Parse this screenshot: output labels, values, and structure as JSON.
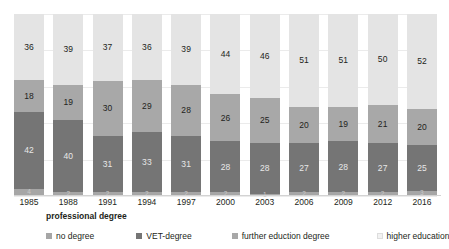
{
  "chart_data": {
    "type": "bar",
    "subtype": "stacked-100-percent",
    "title": "",
    "xlabel": "professional degree",
    "ylabel": "",
    "ylim": [
      0,
      100
    ],
    "grid": true,
    "legend_position": "bottom",
    "categories": [
      "1985",
      "1988",
      "1991",
      "1994",
      "1997",
      "2000",
      "2003",
      "2006",
      "2009",
      "2012",
      "2016"
    ],
    "series": [
      {
        "name": "no degree",
        "color": "#a6a6a6",
        "values": [
          4,
          2,
          2,
          2,
          2,
          2,
          1,
          2,
          2,
          2,
          3
        ]
      },
      {
        "name": "VET-degree",
        "color": "#757575",
        "values": [
          42,
          40,
          31,
          33,
          31,
          28,
          28,
          27,
          28,
          27,
          25
        ]
      },
      {
        "name": "further eduction degree",
        "color": "#a8a8a8",
        "values": [
          18,
          19,
          30,
          29,
          28,
          26,
          25,
          20,
          19,
          21,
          20
        ]
      },
      {
        "name": "higher education",
        "color": "#e4e4e4",
        "values": [
          36,
          39,
          37,
          36,
          39,
          44,
          46,
          51,
          51,
          50,
          52
        ]
      }
    ]
  },
  "axis": {
    "title": "professional degree"
  },
  "legend": {
    "items": [
      {
        "label": "no degree",
        "color": "#a6a6a6"
      },
      {
        "label": "VET-degree",
        "color": "#757575"
      },
      {
        "label": "further eduction degree",
        "color": "#a8a8a8"
      },
      {
        "label": "higher education",
        "color": "#f2f2f2"
      }
    ]
  }
}
